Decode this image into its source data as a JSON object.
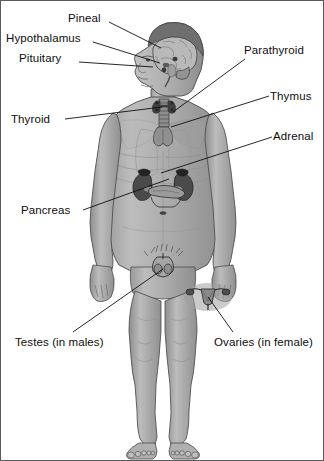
{
  "figure": {
    "background_color": "#ffffff",
    "border_color": "#5a5a5a",
    "body_fill": "#a8a8a8",
    "body_shadow": "#8c8c8c",
    "body_highlight": "#c4c4c4",
    "outline_color": "#3a3a3a",
    "organ_dark": "#4a4a4a",
    "organ_mid": "#6e6e6e",
    "leader_line_color": "#101010",
    "label_color": "#0d0d0d"
  },
  "labels": [
    {
      "id": "pineal",
      "text": "Pineal",
      "x": 67,
      "y": 11,
      "anchor": "left",
      "leader": {
        "x1": 108,
        "y1": 21,
        "x2": 160,
        "y2": 47
      }
    },
    {
      "id": "hypothalamus",
      "text": "Hypothalamus",
      "x": 5,
      "y": 31,
      "anchor": "left",
      "leader": {
        "x1": 92,
        "y1": 41,
        "x2": 159,
        "y2": 62
      }
    },
    {
      "id": "pituitary",
      "text": "Pituitary",
      "x": 18,
      "y": 51,
      "anchor": "left",
      "leader": {
        "x1": 78,
        "y1": 61,
        "x2": 152,
        "y2": 66
      }
    },
    {
      "id": "parathyroid",
      "text": "Parathyroid",
      "x": 243,
      "y": 43,
      "anchor": "left",
      "leader": {
        "x1": 244,
        "y1": 58,
        "x2": 172,
        "y2": 111
      }
    },
    {
      "id": "thymus",
      "text": "Thymus",
      "x": 269,
      "y": 89,
      "anchor": "left",
      "leader": {
        "x1": 268,
        "y1": 95,
        "x2": 170,
        "y2": 126
      }
    },
    {
      "id": "thyroid",
      "text": "Thyroid",
      "x": 10,
      "y": 112,
      "anchor": "left",
      "leader": {
        "x1": 64,
        "y1": 118,
        "x2": 161,
        "y2": 106
      }
    },
    {
      "id": "adrenal",
      "text": "Adrenal",
      "x": 272,
      "y": 129,
      "anchor": "left",
      "leader": {
        "x1": 271,
        "y1": 136,
        "x2": 160,
        "y2": 172
      }
    },
    {
      "id": "pancreas",
      "text": "Pancreas",
      "x": 20,
      "y": 203,
      "anchor": "left",
      "leader": {
        "x1": 82,
        "y1": 209,
        "x2": 168,
        "y2": 178
      }
    },
    {
      "id": "testes",
      "text": "Testes (in males)",
      "x": 14,
      "y": 335,
      "anchor": "left",
      "leader": {
        "x1": 72,
        "y1": 331,
        "x2": 162,
        "y2": 268
      }
    },
    {
      "id": "ovaries",
      "text": "Ovaries (in female)",
      "x": 213,
      "y": 335,
      "anchor": "left",
      "leader": {
        "x1": 232,
        "y1": 331,
        "x2": 207,
        "y2": 296
      }
    }
  ]
}
